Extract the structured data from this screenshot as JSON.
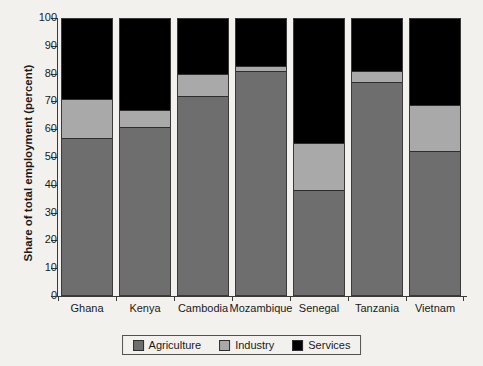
{
  "chart_data": {
    "type": "bar",
    "stacked": true,
    "title": "",
    "xlabel": "",
    "ylabel": "Share of total employment (percent)",
    "ylim": [
      0,
      100
    ],
    "ytick_labels": [
      "0",
      "10",
      "20",
      "30",
      "40",
      "50",
      "60",
      "70",
      "80",
      "90",
      "100"
    ],
    "yticks": [
      0,
      10,
      20,
      30,
      40,
      50,
      60,
      70,
      80,
      90,
      100
    ],
    "grid": false,
    "legend_position": "bottom-center",
    "categories": [
      "Ghana",
      "Kenya",
      "Cambodia",
      "Mozambique",
      "Senegal",
      "Tanzania",
      "Vietnam"
    ],
    "series": [
      {
        "name": "Agriculture",
        "color": "#6e6e6e",
        "values": [
          57,
          61,
          72,
          81,
          38,
          77,
          52
        ]
      },
      {
        "name": "Industry",
        "color": "#a9a9a9",
        "values": [
          14,
          6,
          8,
          2,
          17,
          4,
          17
        ]
      },
      {
        "name": "Services",
        "color": "#000000",
        "values": [
          29,
          33,
          20,
          17,
          45,
          19,
          31
        ]
      }
    ]
  },
  "legend": {
    "items": [
      {
        "label": "Agriculture",
        "color": "#6e6e6e"
      },
      {
        "label": "Industry",
        "color": "#a9a9a9"
      },
      {
        "label": "Services",
        "color": "#000000"
      }
    ]
  }
}
